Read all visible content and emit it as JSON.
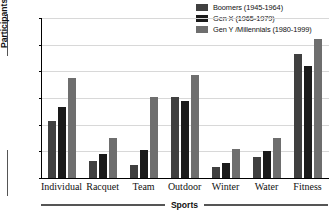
{
  "chart_data": {
    "type": "bar",
    "title": "",
    "xlabel": "Sports",
    "ylabel": "Participants (in Millions)",
    "ylim": [
      0,
      60
    ],
    "ytick_step": 10,
    "yticks": [
      0,
      10,
      20,
      30,
      40,
      50,
      60
    ],
    "grid": true,
    "legend_position": "top-right",
    "categories": [
      "Individual",
      "Racquet",
      "Team",
      "Outdoor",
      "Winter",
      "Water",
      "Fitness"
    ],
    "series": [
      {
        "name": "Boomers (1945-1964)",
        "color": "#404040",
        "values": [
          21.5,
          6.5,
          5.0,
          30.5,
          4.0,
          8.0,
          46.5
        ]
      },
      {
        "name": "Gen X (1965-1979)",
        "color": "#1a1a1a",
        "values": [
          26.5,
          9.0,
          10.5,
          29.0,
          5.5,
          10.0,
          42.0
        ]
      },
      {
        "name": "Gen Y / Millennials (1980-1999)",
        "color": "#6e6e6e",
        "values": [
          37.5,
          15.0,
          30.5,
          38.5,
          11.0,
          15.0,
          52.0
        ]
      }
    ]
  },
  "legend": {
    "items": [
      {
        "label": "Boomers (1945-1964)",
        "color": "#404040"
      },
      {
        "label": "Gen X (1965-1979)",
        "color": "#1a1a1a"
      },
      {
        "label": "Gen Y /Millennials (1980-1999)",
        "color": "#6e6e6e"
      }
    ]
  },
  "axes": {
    "y_title": "Participants (in Millions)",
    "x_title": "Sports",
    "y_tick_labels": [
      "60",
      "50",
      "40",
      "30",
      "20",
      "10",
      "0"
    ],
    "x_tick_labels": [
      "Individual",
      "Racquet",
      "Team",
      "Outdoor",
      "Winter",
      "Water",
      "Fitness"
    ]
  }
}
